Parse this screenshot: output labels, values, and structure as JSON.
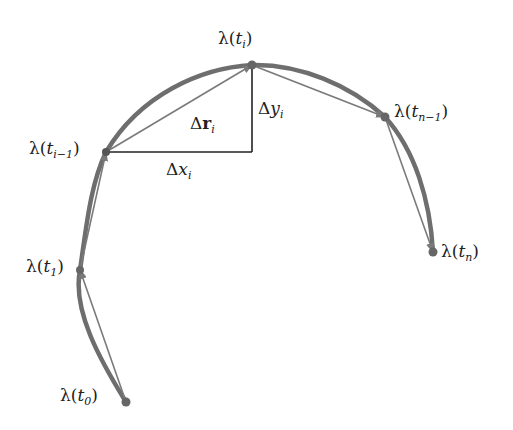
{
  "colors": {
    "curve": "#6e6e6e",
    "chord": "#7a7a7a",
    "triangle": "#222222",
    "point": "#666666",
    "text": "#222222"
  },
  "points": [
    {
      "id": "t0",
      "x": 126,
      "y": 402
    },
    {
      "id": "t1",
      "x": 80,
      "y": 270
    },
    {
      "id": "ti-1",
      "x": 106,
      "y": 152
    },
    {
      "id": "ti",
      "x": 252,
      "y": 65
    },
    {
      "id": "tn-1",
      "x": 385,
      "y": 117
    },
    {
      "id": "tn",
      "x": 433,
      "y": 252
    }
  ],
  "labels": {
    "lambda": "λ",
    "t": "t",
    "open": "(",
    "close": ")",
    "sub_0": "0",
    "sub_1": "1",
    "sub_i_minus_1": "i−1",
    "sub_i": "i",
    "sub_n_minus_1": "n−1",
    "sub_n": "n",
    "delta": "Δ",
    "r": "r",
    "x": "x",
    "y": "y"
  }
}
